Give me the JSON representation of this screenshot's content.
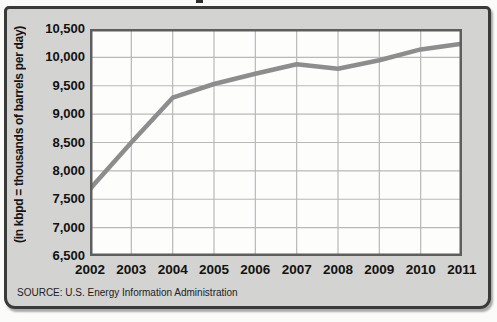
{
  "chart_data": {
    "type": "line",
    "categories": [
      "2002",
      "2003",
      "2004",
      "2005",
      "2006",
      "2007",
      "2008",
      "2009",
      "2010",
      "2011"
    ],
    "values": [
      7680,
      8500,
      9290,
      9530,
      9710,
      9880,
      9800,
      9950,
      10140,
      10240
    ],
    "title": "",
    "xlabel": "",
    "ylabel": "(in kbpd = thousands of barrels per day)",
    "ylim": [
      6500,
      10500
    ],
    "ytick_step": 500,
    "ytick_labels_top_to_bottom": [
      "10,500",
      "10,000",
      "9,500",
      "9,000",
      "8,500",
      "8,000",
      "7,500",
      "7,000",
      "6,500"
    ],
    "grid": true,
    "legend": "none",
    "source_note": "SOURCE: U.S. Energy Information Administration"
  },
  "colors": {
    "frame_background": "#d3d3d1",
    "frame_border": "#3a3a3a",
    "plot_background": "#fdfdfc",
    "gridline": "#b9b9b7",
    "plot_border": "#5e5e5e",
    "data_line": "#8d8d8d",
    "text": "#121212"
  }
}
